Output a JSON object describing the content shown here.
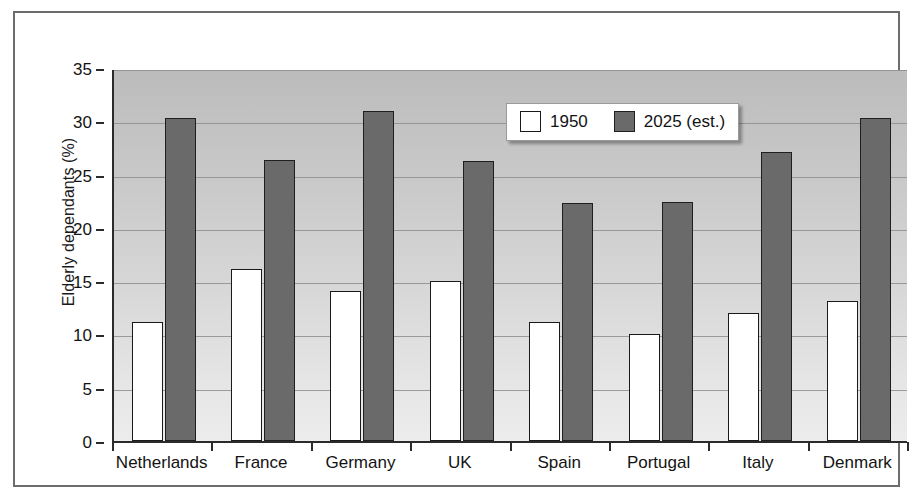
{
  "chart_data": {
    "type": "bar",
    "title": "",
    "xlabel": "",
    "ylabel": "Elderly dependants (%)",
    "categories": [
      "Netherlands",
      "France",
      "Germany",
      "UK",
      "Spain",
      "Portugal",
      "Italy",
      "Denmark"
    ],
    "series": [
      {
        "name": "1950",
        "color": "#ffffff",
        "values": [
          11.2,
          16.1,
          14.1,
          15.0,
          11.2,
          10.0,
          12.0,
          13.1
        ]
      },
      {
        "name": "2025 (est.)",
        "color": "#6a6a6a",
        "values": [
          30.3,
          26.4,
          31.0,
          26.3,
          22.3,
          22.4,
          27.1,
          30.3
        ]
      }
    ],
    "ylim": [
      0,
      35
    ],
    "yticks": [
      0,
      5,
      10,
      15,
      20,
      25,
      30,
      35
    ],
    "ytick_labels": [
      "0",
      "5",
      "10",
      "15",
      "20",
      "25",
      "30",
      "35"
    ],
    "grid": true,
    "legend_position": "top-right",
    "legend_entries": [
      "1950",
      "2025 (est.)"
    ]
  }
}
